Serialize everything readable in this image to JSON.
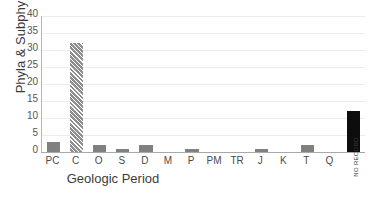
{
  "chart_data": {
    "type": "bar",
    "title": "",
    "xlabel": "Geologic Period",
    "ylabel": "Phyla & Subphyla",
    "categories": [
      "PC",
      "C",
      "O",
      "S",
      "D",
      "M",
      "P",
      "PM",
      "TR",
      "J",
      "K",
      "T",
      "Q",
      "NO RECORD"
    ],
    "values": [
      3,
      32,
      2,
      1,
      2,
      0,
      1,
      0,
      0,
      1,
      0,
      2,
      0,
      12
    ],
    "ylim": [
      0,
      40
    ],
    "yticks": [
      0,
      5,
      10,
      15,
      20,
      25,
      30,
      35,
      40
    ],
    "ytick_labels": [
      "0",
      "5",
      "10",
      "15",
      "20",
      "25",
      "30",
      "35",
      "40"
    ],
    "grid": true,
    "legend": "none",
    "bar_styles": [
      "solid-gray",
      "hatched-gray",
      "solid-gray",
      "solid-gray",
      "solid-gray",
      "solid-gray",
      "solid-gray",
      "solid-gray",
      "solid-gray",
      "solid-gray",
      "solid-gray",
      "solid-gray",
      "solid-gray",
      "solid-black"
    ],
    "colors": {
      "bar_gray": "#808080",
      "bar_hatch_light": "#b9b9b9",
      "bar_hatch_dark": "#8f8f8f",
      "bar_black": "#0d0d0d",
      "gridline": "#ececec",
      "axis": "#a8a8a8",
      "text": "#3c3c3c",
      "background": "#ffffff"
    }
  }
}
